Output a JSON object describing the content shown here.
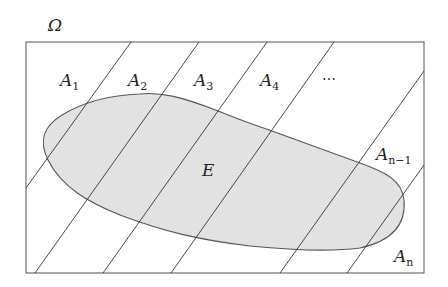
{
  "diagram": {
    "universe_label": "Ω",
    "set_label": "E",
    "partition_labels": [
      {
        "base": "A",
        "sub": "1",
        "x": 40,
        "y": 86
      },
      {
        "base": "A",
        "sub": "2",
        "x": 128,
        "y": 86
      },
      {
        "base": "A",
        "sub": "3",
        "x": 194,
        "y": 86
      },
      {
        "base": "A",
        "sub": "4",
        "x": 260,
        "y": 86
      },
      {
        "base": "A",
        "sub": "n−1",
        "x": 376,
        "y": 160
      },
      {
        "base": "A",
        "sub": "n",
        "x": 394,
        "y": 262
      }
    ],
    "ellipsis": "⋯",
    "colors": {
      "stroke": "#444444",
      "fill_E": "#e2e2e2",
      "background": "#ffffff"
    }
  }
}
